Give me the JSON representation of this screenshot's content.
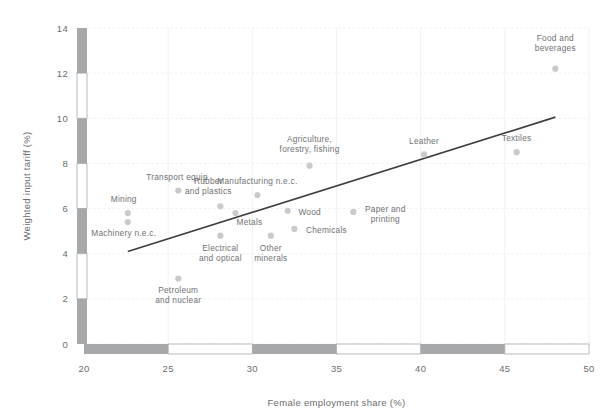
{
  "chart_data": {
    "type": "scatter",
    "title": "",
    "xlabel": "Female employment share (%)",
    "ylabel": "Weighted input tariff (%)",
    "xlim": [
      20,
      50
    ],
    "ylim": [
      0,
      14
    ],
    "xticks": [
      20,
      25,
      30,
      35,
      40,
      45,
      50
    ],
    "yticks": [
      0,
      2,
      4,
      6,
      8,
      10,
      12,
      14
    ],
    "grid": true,
    "legend": "none",
    "point_color": "#c9cacc",
    "trendline_color": "#3f3f41",
    "axis_band_color": "#a6a8aa",
    "points": [
      {
        "label": "Mining",
        "x": 22.6,
        "y": 5.8,
        "label_dx": -4,
        "label_dy": -11,
        "anchor": "middle"
      },
      {
        "label": "Machinery n.e.c.",
        "x": 22.6,
        "y": 5.4,
        "label_dx": -4,
        "label_dy": 14,
        "anchor": "middle"
      },
      {
        "label": "Transport equip.",
        "x": 25.6,
        "y": 6.8,
        "label_dx": 0,
        "label_dy": -11,
        "anchor": "middle"
      },
      {
        "label": "Petroleum\nand nuclear",
        "x": 25.6,
        "y": 2.9,
        "label_dx": 0,
        "label_dy": 14,
        "anchor": "middle"
      },
      {
        "label": "Rubber\nand plastics",
        "x": 28.1,
        "y": 6.1,
        "label_dx": -12,
        "label_dy": -18,
        "anchor": "middle"
      },
      {
        "label": "Electrical\nand optical",
        "x": 28.1,
        "y": 4.8,
        "label_dx": 0,
        "label_dy": 15,
        "anchor": "middle"
      },
      {
        "label": "Metals",
        "x": 29.0,
        "y": 5.8,
        "label_dx": 14,
        "label_dy": 12,
        "anchor": "middle"
      },
      {
        "label": "Manufacturing n.e.c.",
        "x": 30.3,
        "y": 6.6,
        "label_dx": 0,
        "label_dy": -11,
        "anchor": "middle"
      },
      {
        "label": "Other\nminerals",
        "x": 31.1,
        "y": 4.8,
        "label_dx": 0,
        "label_dy": 15,
        "anchor": "middle"
      },
      {
        "label": "Wood",
        "x": 32.1,
        "y": 5.9,
        "label_dx": 22,
        "label_dy": 4,
        "anchor": "middle"
      },
      {
        "label": "Chemicals",
        "x": 32.5,
        "y": 5.1,
        "label_dx": 32,
        "label_dy": 4,
        "anchor": "middle"
      },
      {
        "label": "Agriculture,\nforestry, fishing",
        "x": 33.4,
        "y": 7.9,
        "label_dx": 0,
        "label_dy": -19,
        "anchor": "middle"
      },
      {
        "label": "Paper and\nprinting",
        "x": 36.0,
        "y": 5.85,
        "label_dx": 32,
        "label_dy": 0,
        "anchor": "middle"
      },
      {
        "label": "Leather",
        "x": 40.2,
        "y": 8.4,
        "label_dx": 0,
        "label_dy": -10,
        "anchor": "middle"
      },
      {
        "label": "Textiles",
        "x": 45.7,
        "y": 8.5,
        "label_dx": 0,
        "label_dy": -11,
        "anchor": "middle"
      },
      {
        "label": "Food and\nbeverages",
        "x": 48.0,
        "y": 12.2,
        "label_dx": 0,
        "label_dy": -23,
        "anchor": "middle"
      }
    ],
    "trendline": {
      "x0": 22.6,
      "y0": 4.1,
      "x1": 48.0,
      "y1": 10.05
    }
  }
}
